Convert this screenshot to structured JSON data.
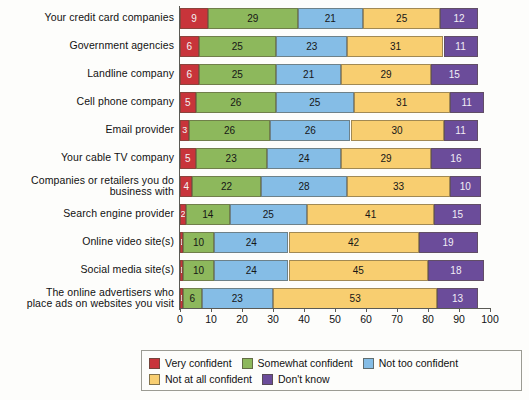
{
  "chart_data": {
    "type": "bar",
    "orientation": "horizontal",
    "stacked": true,
    "title": "",
    "xlabel": "",
    "ylabel": "",
    "xlim": [
      0,
      100
    ],
    "xticks": [
      0,
      10,
      20,
      30,
      40,
      50,
      60,
      70,
      80,
      90,
      100
    ],
    "grid": false,
    "legend_position": "bottom",
    "categories": [
      "Your credit card companies",
      "Government agencies",
      "Landline company",
      "Cell phone company",
      "Email provider",
      "Your cable TV company",
      "Companies or retailers you do business with",
      "Search engine provider",
      "Online video site(s)",
      "Social media site(s)",
      "The online advertisers who place ads on websites you visit"
    ],
    "series": [
      {
        "name": "Very confident",
        "color": "#C8343A",
        "values": [
          9,
          6,
          6,
          5,
          3,
          5,
          4,
          2,
          1,
          1,
          1
        ]
      },
      {
        "name": "Somewhat confident",
        "color": "#8DB85C",
        "values": [
          29,
          25,
          25,
          26,
          26,
          23,
          22,
          14,
          10,
          10,
          6
        ]
      },
      {
        "name": "Not too confident",
        "color": "#85BDE6",
        "values": [
          21,
          23,
          21,
          25,
          26,
          24,
          28,
          25,
          24,
          24,
          23
        ]
      },
      {
        "name": "Not at all confident",
        "color": "#F8CE70",
        "values": [
          25,
          31,
          29,
          31,
          30,
          29,
          33,
          41,
          42,
          45,
          53
        ]
      },
      {
        "name": "Don't know",
        "color": "#6B4C9A",
        "values": [
          12,
          11,
          15,
          11,
          11,
          16,
          10,
          15,
          19,
          18,
          13
        ]
      }
    ]
  },
  "labels": {
    "rows": [
      {
        "line1": "Your credit card companies",
        "line2": ""
      },
      {
        "line1": "Government agencies",
        "line2": ""
      },
      {
        "line1": "Landline company",
        "line2": ""
      },
      {
        "line1": "Cell phone company",
        "line2": ""
      },
      {
        "line1": "Email provider",
        "line2": ""
      },
      {
        "line1": "Your cable TV company",
        "line2": ""
      },
      {
        "line1": "Companies or retailers you do",
        "line2": "business with"
      },
      {
        "line1": "Search engine provider",
        "line2": ""
      },
      {
        "line1": "Online video site(s)",
        "line2": ""
      },
      {
        "line1": "Social media site(s)",
        "line2": ""
      },
      {
        "line1": "The online advertisers who",
        "line2": "place ads on websites you visit"
      }
    ]
  }
}
